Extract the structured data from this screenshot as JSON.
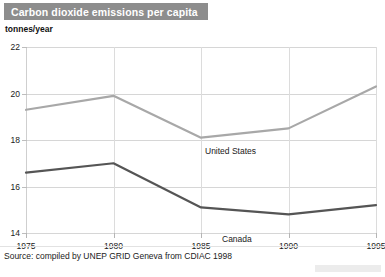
{
  "header": {
    "title": "Carbon dioxide emissions per capita",
    "band_color": "#8d8d8d",
    "title_color": "#ffffff"
  },
  "unit_label": "tonnes/year",
  "source": {
    "text": "Source: compiled by UNEP GRID Geneva from CDIAC 1998"
  },
  "chart_data": {
    "type": "line",
    "title": "Carbon dioxide emissions per capita",
    "xlabel": "",
    "ylabel": "tonnes/year",
    "x": [
      1975,
      1980,
      1985,
      1990,
      1995
    ],
    "xtick_labels": [
      "1975",
      "1980",
      "1985",
      "1990",
      "1995"
    ],
    "ytick_labels": [
      "22",
      "20",
      "18",
      "16",
      "14"
    ],
    "yticks": [
      22,
      20,
      18,
      16,
      14
    ],
    "ylim": [
      14,
      22
    ],
    "xlim": [
      1975,
      1995
    ],
    "grid": "horizontal",
    "legend": "inline-labels",
    "series": [
      {
        "name": "United States",
        "color": "#a8a8a8",
        "values": [
          19.3,
          19.9,
          18.1,
          18.5,
          20.3
        ],
        "label": "United States"
      },
      {
        "name": "Canada",
        "color": "#555555",
        "values": [
          16.6,
          17.0,
          15.1,
          14.8,
          15.2
        ],
        "label": "Canada"
      }
    ]
  }
}
